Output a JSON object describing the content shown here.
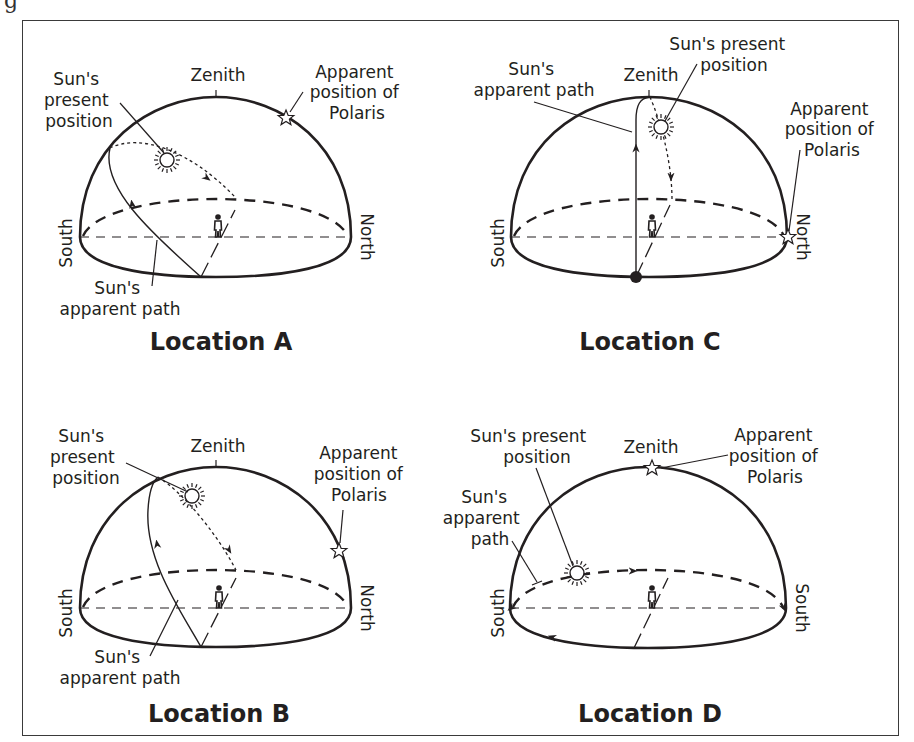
{
  "figure": {
    "cutoff_text": "g",
    "panels": [
      {
        "id": "A",
        "title": "Location A",
        "labels": {
          "zenith": "Zenith",
          "sun_present": [
            "Sun's",
            "present",
            "position"
          ],
          "polaris": [
            "Apparent",
            "position of",
            "Polaris"
          ],
          "sun_path": [
            "Sun's",
            "apparent path"
          ],
          "left_dir": "South",
          "right_dir": "North"
        }
      },
      {
        "id": "C",
        "title": "Location C",
        "labels": {
          "zenith": "Zenith",
          "sun_present": [
            "Sun's present",
            "position"
          ],
          "polaris": [
            "Apparent",
            "position of",
            "Polaris"
          ],
          "sun_path": [
            "Sun's",
            "apparent path"
          ],
          "left_dir": "South",
          "right_dir": "North"
        }
      },
      {
        "id": "B",
        "title": "Location B",
        "labels": {
          "zenith": "Zenith",
          "sun_present": [
            "Sun's",
            "present",
            "position"
          ],
          "polaris": [
            "Apparent",
            "position of",
            "Polaris"
          ],
          "sun_path": [
            "Sun's",
            "apparent path"
          ],
          "left_dir": "South",
          "right_dir": "North"
        }
      },
      {
        "id": "D",
        "title": "Location D",
        "labels": {
          "zenith": "Zenith",
          "sun_present": [
            "Sun's present",
            "position"
          ],
          "polaris": [
            "Apparent",
            "position of",
            "Polaris"
          ],
          "sun_path": [
            "Sun's",
            "apparent",
            "path"
          ],
          "left_dir": "South",
          "right_dir": "South"
        }
      }
    ]
  },
  "colors": {
    "ink": "#231f20",
    "frame": "#3a3a3a",
    "background": "#ffffff"
  }
}
